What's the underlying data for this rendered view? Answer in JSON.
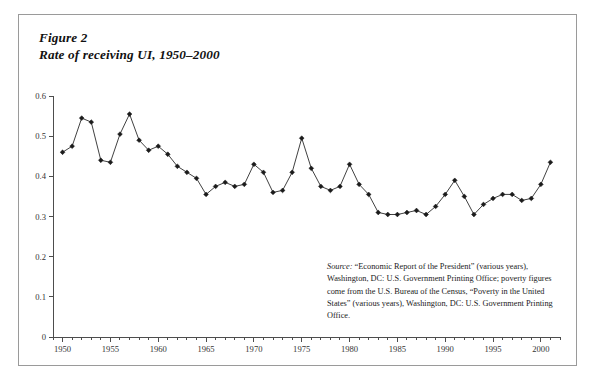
{
  "figure": {
    "number_label": "Figure 2",
    "title": "Rate of receiving UI, 1950–2000"
  },
  "source_note": {
    "label": "Source:",
    "text": " “Economic Report of the President” (various years), Washington, DC: U.S. Government Printing Office; poverty figures come from the U.S. Bureau of the Census, “Poverty in the United States” (various years), Washington, DC: U.S. Government Printing Office."
  },
  "colors": {
    "line": "#2b2b2b",
    "marker": "#1b1b1b",
    "axis": "#4d4d4d",
    "frame": "#9a9a9a",
    "background": "#ffffff"
  },
  "chart_data": {
    "type": "line",
    "title": "Rate of receiving UI, 1950–2000",
    "xlabel": "",
    "ylabel": "",
    "xlim": [
      1949,
      2002
    ],
    "ylim": [
      0,
      0.6
    ],
    "grid": false,
    "legend": "none",
    "y_ticks": [
      0,
      0.1,
      0.2,
      0.3,
      0.4,
      0.5,
      0.6
    ],
    "y_tick_labels": [
      "0",
      "0.1",
      "0.2",
      "0.3",
      "0.4",
      "0.5",
      "0.6"
    ],
    "x_ticks": [
      1950,
      1955,
      1960,
      1965,
      1970,
      1975,
      1980,
      1985,
      1990,
      1995,
      2000
    ],
    "x_tick_labels": [
      "1950",
      "1955",
      "1960",
      "1965",
      "1970",
      "1975",
      "1980",
      "1985",
      "1990",
      "1995",
      "2000"
    ],
    "x_minor_tick_interval": 1,
    "marker": "diamond",
    "x": [
      1950,
      1951,
      1952,
      1953,
      1954,
      1955,
      1956,
      1957,
      1958,
      1959,
      1960,
      1961,
      1962,
      1963,
      1964,
      1965,
      1966,
      1967,
      1968,
      1969,
      1970,
      1971,
      1972,
      1973,
      1974,
      1975,
      1976,
      1977,
      1978,
      1979,
      1980,
      1981,
      1982,
      1983,
      1984,
      1985,
      1986,
      1987,
      1988,
      1989,
      1990,
      1991,
      1992,
      1993,
      1994,
      1995,
      1996,
      1997,
      1998,
      1999,
      2000,
      2001
    ],
    "values": [
      0.46,
      0.475,
      0.545,
      0.535,
      0.44,
      0.435,
      0.505,
      0.555,
      0.49,
      0.465,
      0.475,
      0.455,
      0.425,
      0.41,
      0.395,
      0.355,
      0.375,
      0.385,
      0.375,
      0.38,
      0.43,
      0.41,
      0.36,
      0.365,
      0.41,
      0.495,
      0.42,
      0.375,
      0.365,
      0.375,
      0.43,
      0.38,
      0.355,
      0.31,
      0.305,
      0.305,
      0.31,
      0.315,
      0.305,
      0.325,
      0.355,
      0.39,
      0.35,
      0.305,
      0.33,
      0.345,
      0.355,
      0.355,
      0.34,
      0.345,
      0.38,
      0.435
    ],
    "series": [
      {
        "name": "Rate of receiving UI",
        "values": [
          0.46,
          0.475,
          0.545,
          0.535,
          0.44,
          0.435,
          0.505,
          0.555,
          0.49,
          0.465,
          0.475,
          0.455,
          0.425,
          0.41,
          0.395,
          0.355,
          0.375,
          0.385,
          0.375,
          0.38,
          0.43,
          0.41,
          0.36,
          0.365,
          0.41,
          0.495,
          0.42,
          0.375,
          0.365,
          0.375,
          0.43,
          0.38,
          0.355,
          0.31,
          0.305,
          0.305,
          0.31,
          0.315,
          0.305,
          0.325,
          0.355,
          0.39,
          0.35,
          0.305,
          0.33,
          0.345,
          0.355,
          0.355,
          0.34,
          0.345,
          0.38,
          0.435
        ]
      }
    ]
  }
}
